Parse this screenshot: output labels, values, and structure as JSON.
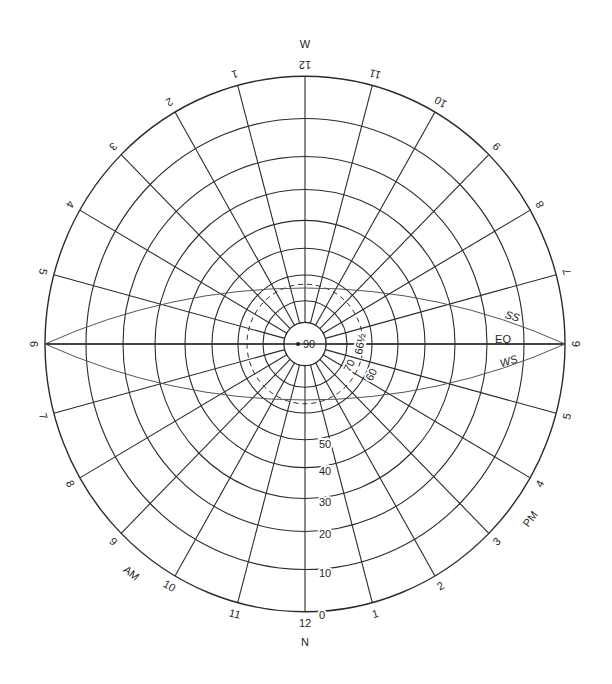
{
  "colors": {
    "line": "#2b2b2b",
    "sunpath": "#555555",
    "text": "#1f1f1f",
    "background": "#ffffff"
  },
  "geometry": {
    "center": [
      305,
      344
    ],
    "scale_y": 1.03,
    "outer_radius": 260,
    "center_disc_radius": 21,
    "altitude_rings": [
      {
        "altitude": 0,
        "r": 260
      },
      {
        "altitude": 10,
        "r": 219
      },
      {
        "altitude": 20,
        "r": 182
      },
      {
        "altitude": 30,
        "r": 150
      },
      {
        "altitude": 40,
        "r": 120
      },
      {
        "altitude": 50,
        "r": 93
      },
      {
        "altitude": 60,
        "r": 67
      },
      {
        "altitude": 70,
        "r": 42
      },
      {
        "altitude": 80,
        "r": 21
      }
    ],
    "dashed_ring": {
      "altitude": "66½",
      "r": 58
    },
    "hour_line_step_deg": 15
  },
  "compass": {
    "bottom": "N",
    "top": "W"
  },
  "center_label": "90",
  "altitude_labels": [
    {
      "text": "0",
      "x": 322,
      "y": 616,
      "rot": 0
    },
    {
      "text": "10",
      "x": 325,
      "y": 574,
      "rot": 0
    },
    {
      "text": "20",
      "x": 325,
      "y": 535,
      "rot": 0
    },
    {
      "text": "30",
      "x": 325,
      "y": 503,
      "rot": 0
    },
    {
      "text": "40",
      "x": 325,
      "y": 472,
      "rot": 0
    },
    {
      "text": "50",
      "x": 325,
      "y": 445,
      "rot": 0
    },
    {
      "text": "60",
      "x": 372,
      "y": 375,
      "rot": -62
    },
    {
      "text": "70",
      "x": 350,
      "y": 366,
      "rot": -62
    },
    {
      "text": "66½",
      "x": 361,
      "y": 344,
      "rot": -80
    }
  ],
  "hour_labels": [
    {
      "text": "12",
      "alpha": 0
    },
    {
      "text": "1",
      "alpha": 15
    },
    {
      "text": "2",
      "alpha": 30
    },
    {
      "text": "3",
      "alpha": 45
    },
    {
      "text": "4",
      "alpha": 60
    },
    {
      "text": "5",
      "alpha": 75
    },
    {
      "text": "6",
      "alpha": 90
    },
    {
      "text": "7",
      "alpha": 105
    },
    {
      "text": "8",
      "alpha": 120
    },
    {
      "text": "9",
      "alpha": 135
    },
    {
      "text": "10",
      "alpha": 150
    },
    {
      "text": "11",
      "alpha": 165
    },
    {
      "text": "12",
      "alpha": 180
    },
    {
      "text": "1",
      "alpha": -165
    },
    {
      "text": "2",
      "alpha": -150
    },
    {
      "text": "3",
      "alpha": -135
    },
    {
      "text": "4",
      "alpha": -120
    },
    {
      "text": "5",
      "alpha": -105
    },
    {
      "text": "6",
      "alpha": -90
    },
    {
      "text": "7",
      "alpha": -75
    },
    {
      "text": "8",
      "alpha": -60
    },
    {
      "text": "9",
      "alpha": -45
    },
    {
      "text": "10",
      "alpha": -30
    },
    {
      "text": "11",
      "alpha": -15
    }
  ],
  "period_labels": [
    {
      "text": "AM",
      "alpha": -38,
      "r": 283
    },
    {
      "text": "PM",
      "alpha": 53,
      "r": 283
    }
  ],
  "sun_paths": [
    {
      "name": "SS",
      "label": "SS",
      "sagitta": -56,
      "label_x": 512,
      "label_y": 317,
      "rot": 17
    },
    {
      "name": "EQ",
      "label": "EQ",
      "sagitta": 0,
      "label_x": 503,
      "label_y": 340,
      "rot": 0
    },
    {
      "name": "WS",
      "label": "WS",
      "sagitta": 56,
      "label_x": 509,
      "label_y": 362,
      "rot": -17
    }
  ]
}
